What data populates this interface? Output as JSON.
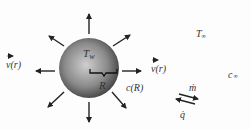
{
  "diagram": {
    "sphere": {
      "cx": 89,
      "cy": 68,
      "r": 30,
      "label_surface_temp": "T",
      "label_surface_temp_sub": "w",
      "label_radius": "R"
    },
    "labels": {
      "velocity_left": "v(r)",
      "velocity_right": "v(r)",
      "concentration_surface": "c(R)",
      "temp_far": "T",
      "temp_far_sub": "∞",
      "conc_far": "c",
      "conc_far_sub": "∞",
      "mass_flux": "ṁ",
      "heat_flux": "q̇"
    },
    "colors": {
      "arrow": "#222222",
      "sphere_light": "#c8c8c8",
      "sphere_dark": "#4a4a4a",
      "text": "#333333"
    }
  }
}
